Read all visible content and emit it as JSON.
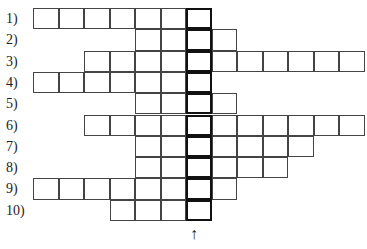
{
  "puzzle": {
    "rows": [
      {
        "label": "1)",
        "start": 0,
        "end": 6
      },
      {
        "label": "2)",
        "start": 4,
        "end": 7
      },
      {
        "label": "3)",
        "start": 2,
        "end": 12
      },
      {
        "label": "4)",
        "start": 0,
        "end": 6
      },
      {
        "label": "5)",
        "start": 4,
        "end": 7
      },
      {
        "label": "6)",
        "start": 2,
        "end": 12
      },
      {
        "label": "7)",
        "start": 4,
        "end": 10
      },
      {
        "label": "8)",
        "start": 4,
        "end": 9
      },
      {
        "label": "9)",
        "start": 0,
        "end": 7
      },
      {
        "label": "10)",
        "start": 3,
        "end": 6
      }
    ],
    "highlight_column": 6,
    "arrow": "↑"
  }
}
